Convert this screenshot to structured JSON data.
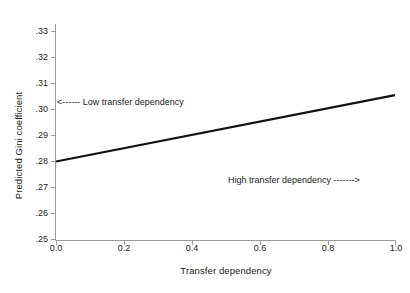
{
  "chart_data": {
    "type": "line",
    "title": "",
    "xlabel": "Transfer dependency",
    "ylabel": "Predicted Gini coefficient",
    "xlim": [
      0.0,
      1.0
    ],
    "ylim": [
      0.25,
      0.33
    ],
    "grid": false,
    "legend": null,
    "xticks": [
      "0.0",
      "0.2",
      "0.4",
      "0.6",
      "0.8",
      "1.0"
    ],
    "xtick_values": [
      0.0,
      0.2,
      0.4,
      0.6,
      0.8,
      1.0
    ],
    "yticks": [
      ".33",
      ".32",
      ".31",
      ".30",
      ".29",
      ".28",
      ".27",
      ".26",
      ".25"
    ],
    "ytick_values": [
      0.33,
      0.32,
      0.31,
      0.3,
      0.29,
      0.28,
      0.27,
      0.26,
      0.25
    ],
    "series": [
      {
        "name": "Predicted Gini coefficient",
        "x": [
          0.0,
          1.0
        ],
        "values": [
          0.28,
          0.3055
        ],
        "color": "#111111",
        "line_width": 2.2
      }
    ],
    "annotations": [
      {
        "id": "low-transfer-dependency",
        "text": "<------ Low transfer dependency",
        "label": "Low transfer dependency",
        "arrow": "left",
        "x": 0.0,
        "y": 0.3
      },
      {
        "id": "high-transfer-dependency",
        "text": "High transfer dependency ------->",
        "label": "High transfer dependency",
        "arrow": "right",
        "x": 0.52,
        "y": 0.27
      }
    ],
    "axis_color": "#9a9a9a",
    "background_color": "#ffffff"
  }
}
